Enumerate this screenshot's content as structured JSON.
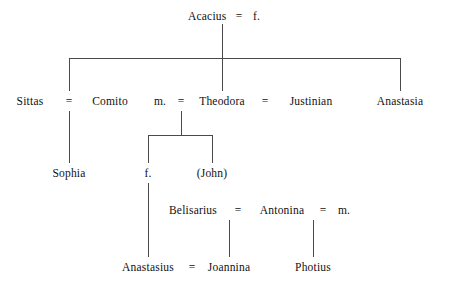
{
  "diagram": {
    "type": "genealogical-tree",
    "line_color": "#4a4a4a",
    "text_color": "#111111",
    "background": "#ffffff",
    "marriage_symbol": "=",
    "generations": [
      {
        "level": 1,
        "members": [
          {
            "id": "acacius",
            "label": "Acacius"
          },
          {
            "id": "acacius_wife",
            "label": "f."
          }
        ],
        "unions": [
          {
            "spouses": [
              "Acacius",
              "f."
            ],
            "symbol": "="
          }
        ]
      },
      {
        "level": 2,
        "members": [
          {
            "id": "sittas",
            "label": "Sittas"
          },
          {
            "id": "comito",
            "label": "Comito"
          },
          {
            "id": "m1",
            "label": "m."
          },
          {
            "id": "theodora",
            "label": "Theodora"
          },
          {
            "id": "justinian",
            "label": "Justinian"
          },
          {
            "id": "anastasia",
            "label": "Anastasia"
          }
        ],
        "unions": [
          {
            "spouses": [
              "Sittas",
              "Comito"
            ],
            "symbol": "="
          },
          {
            "spouses": [
              "m.",
              "Theodora"
            ],
            "symbol": "="
          },
          {
            "spouses": [
              "Theodora",
              "Justinian"
            ],
            "symbol": "="
          }
        ]
      },
      {
        "level": 3,
        "members": [
          {
            "id": "sophia",
            "label": "Sophia"
          },
          {
            "id": "f2",
            "label": "f."
          },
          {
            "id": "john",
            "label": "(John)"
          }
        ],
        "unions": []
      },
      {
        "level": 4,
        "members": [
          {
            "id": "belisarius",
            "label": "Belisarius"
          },
          {
            "id": "antonina",
            "label": "Antonina"
          },
          {
            "id": "m2",
            "label": "m."
          }
        ],
        "unions": [
          {
            "spouses": [
              "Belisarius",
              "Antonina"
            ],
            "symbol": "="
          },
          {
            "spouses": [
              "Antonina",
              "m."
            ],
            "symbol": "="
          }
        ]
      },
      {
        "level": 5,
        "members": [
          {
            "id": "anastasius",
            "label": "Anastasius"
          },
          {
            "id": "joannina",
            "label": "Joannina"
          },
          {
            "id": "photius",
            "label": "Photius"
          }
        ],
        "unions": [
          {
            "spouses": [
              "Anastasius",
              "Joannina"
            ],
            "symbol": "="
          }
        ]
      }
    ],
    "labels": {
      "acacius": "Acacius",
      "acacius_wife": "f.",
      "eq_top": "=",
      "sittas": "Sittas",
      "eq_sittas_comito": "=",
      "comito": "Comito",
      "m1": "m.",
      "eq_m_theodora": "=",
      "theodora": "Theodora",
      "eq_theodora_justinian": "=",
      "justinian": "Justinian",
      "anastasia": "Anastasia",
      "sophia": "Sophia",
      "f2": "f.",
      "john": "(John)",
      "belisarius": "Belisarius",
      "eq_belisarius_antonina": "=",
      "antonina": "Antonina",
      "eq_antonina_m": "=",
      "m2": "m.",
      "anastasius": "Anastasius",
      "eq_anastasius_joannina": "=",
      "joannina": "Joannina",
      "photius": "Photius"
    }
  }
}
